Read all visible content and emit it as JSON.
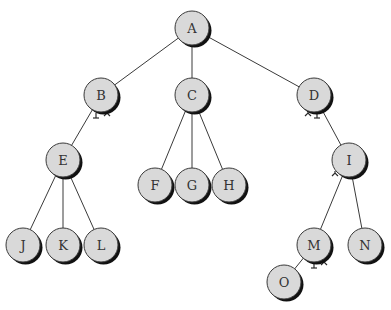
{
  "diagram": {
    "type": "tree",
    "root": "A",
    "nodes": [
      {
        "id": "A",
        "label": "A",
        "x": 192,
        "y": 28
      },
      {
        "id": "B",
        "label": "B",
        "x": 101,
        "y": 95
      },
      {
        "id": "C",
        "label": "C",
        "x": 192,
        "y": 95
      },
      {
        "id": "D",
        "label": "D",
        "x": 314,
        "y": 95
      },
      {
        "id": "E",
        "label": "E",
        "x": 63,
        "y": 160
      },
      {
        "id": "F",
        "label": "F",
        "x": 155,
        "y": 185
      },
      {
        "id": "G",
        "label": "G",
        "x": 192,
        "y": 185
      },
      {
        "id": "H",
        "label": "H",
        "x": 229,
        "y": 185
      },
      {
        "id": "I",
        "label": "I",
        "x": 349,
        "y": 160
      },
      {
        "id": "J",
        "label": "J",
        "x": 23,
        "y": 245
      },
      {
        "id": "K",
        "label": "K",
        "x": 63,
        "y": 245
      },
      {
        "id": "L",
        "label": "L",
        "x": 101,
        "y": 245
      },
      {
        "id": "M",
        "label": "M",
        "x": 314,
        "y": 245
      },
      {
        "id": "N",
        "label": "N",
        "x": 365,
        "y": 245
      },
      {
        "id": "O",
        "label": "O",
        "x": 284,
        "y": 282
      }
    ],
    "edges": [
      [
        "A",
        "B"
      ],
      [
        "A",
        "C"
      ],
      [
        "A",
        "D"
      ],
      [
        "B",
        "E"
      ],
      [
        "C",
        "F"
      ],
      [
        "C",
        "G"
      ],
      [
        "C",
        "H"
      ],
      [
        "D",
        "I"
      ],
      [
        "E",
        "J"
      ],
      [
        "E",
        "K"
      ],
      [
        "E",
        "L"
      ],
      [
        "I",
        "M"
      ],
      [
        "I",
        "N"
      ],
      [
        "M",
        "O"
      ]
    ],
    "null_pointer_marks": [
      {
        "node": "B",
        "marks": [
          {
            "dx": -5,
            "dy": 18,
            "style": "T"
          },
          {
            "dx": 6,
            "dy": 17,
            "style": "Y"
          }
        ]
      },
      {
        "node": "D",
        "marks": [
          {
            "dx": -6,
            "dy": 17,
            "style": "Y"
          },
          {
            "dx": 3,
            "dy": 18,
            "style": "T"
          }
        ]
      },
      {
        "node": "I",
        "marks": [
          {
            "dx": -14,
            "dy": 12,
            "style": "Y"
          }
        ]
      },
      {
        "node": "M",
        "marks": [
          {
            "dx": 0,
            "dy": 18,
            "style": "T"
          },
          {
            "dx": 10,
            "dy": 16,
            "style": "Y"
          }
        ]
      }
    ],
    "node_radius": 17,
    "colors": {
      "node_fill": "#d9d9d9",
      "node_stroke": "#3a3a3a",
      "shadow": "#111111",
      "edge": "#3a3a3a",
      "label": "#333333"
    }
  }
}
